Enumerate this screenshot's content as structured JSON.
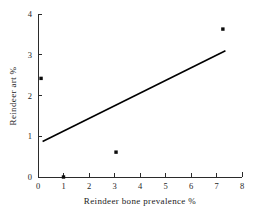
{
  "figure": {
    "background_color": "#ffffff",
    "foreground_color": "#1a1a1a"
  },
  "chart_data": {
    "type": "scatter",
    "title": "",
    "subtitle": "",
    "xlabel": "Reindeer bone prevalence %",
    "ylabel": "Reindeer art %",
    "xlim": [
      0,
      8
    ],
    "ylim": [
      0,
      4
    ],
    "xticks": [
      0,
      1,
      2,
      3,
      4,
      5,
      6,
      7,
      8
    ],
    "yticks": [
      0,
      1,
      2,
      3,
      4
    ],
    "xtick_labels": [
      "0",
      "1",
      "2",
      "3",
      "4",
      "5",
      "6",
      "7",
      "8"
    ],
    "ytick_labels": [
      "0",
      "1",
      "2",
      "3",
      "4"
    ],
    "grid": false,
    "legend": false,
    "legend_position": "none",
    "marker_style": "filled-square",
    "marker_color": "#0b0b0b",
    "line_color": "#000000",
    "points": [
      {
        "x": 0.12,
        "y": 2.42
      },
      {
        "x": 1.0,
        "y": 0.0
      },
      {
        "x": 3.06,
        "y": 0.61
      },
      {
        "x": 7.25,
        "y": 3.63
      }
    ],
    "series": [
      {
        "name": "Observations",
        "type": "scatter",
        "x": [
          0.12,
          1.0,
          3.06,
          7.25
        ],
        "values": [
          2.42,
          0.0,
          0.61,
          3.63
        ]
      },
      {
        "name": "Fitted regression line",
        "type": "line",
        "x": [
          0.18,
          7.35
        ],
        "values": [
          0.87,
          3.1
        ]
      }
    ],
    "fit_line": {
      "x_start": 0.18,
      "y_start": 0.87,
      "x_end": 7.35,
      "y_end": 3.1,
      "slope": 0.311,
      "intercept": 0.814
    },
    "annotations": []
  }
}
